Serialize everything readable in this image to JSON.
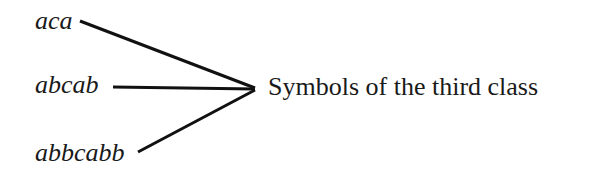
{
  "diagram": {
    "terms": [
      {
        "text": "aca"
      },
      {
        "text": "abcab"
      },
      {
        "text": "abbcabb"
      }
    ],
    "target_label": "Symbols of the third class",
    "edges": [
      {
        "from": "aca",
        "to": "Symbols of the third class"
      },
      {
        "from": "abcab",
        "to": "Symbols of the third class"
      },
      {
        "from": "abbcabb",
        "to": "Symbols of the third class"
      }
    ]
  }
}
